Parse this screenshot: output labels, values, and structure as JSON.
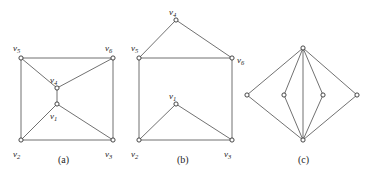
{
  "figure": {
    "background": "#ffffff",
    "edge_color": "#4c4c4c",
    "node_fill": "#ffffff",
    "node_stroke": "#333333",
    "label_color": "#242424"
  },
  "graphs": [
    {
      "id": "graph-a",
      "caption": "(a)",
      "caption_pos": {
        "x": 58,
        "y": 155
      },
      "vertices": [
        {
          "name": "v5",
          "base": "v",
          "sub": "5",
          "x": 21,
          "y": 58,
          "lx": 13,
          "ly": 44
        },
        {
          "name": "v6",
          "base": "v",
          "sub": "6",
          "x": 113,
          "y": 58,
          "lx": 105,
          "ly": 44
        },
        {
          "name": "v4",
          "base": "v",
          "sub": "4",
          "x": 57,
          "y": 88,
          "lx": 50,
          "ly": 76
        },
        {
          "name": "v1",
          "base": "v",
          "sub": "1",
          "x": 57,
          "y": 104,
          "lx": 50,
          "ly": 112
        },
        {
          "name": "v2",
          "base": "v",
          "sub": "2",
          "x": 21,
          "y": 140,
          "lx": 13,
          "ly": 150
        },
        {
          "name": "v3",
          "base": "v",
          "sub": "3",
          "x": 113,
          "y": 140,
          "lx": 105,
          "ly": 150
        }
      ],
      "edges": [
        {
          "from": "v5",
          "to": "v6"
        },
        {
          "from": "v5",
          "to": "v2"
        },
        {
          "from": "v2",
          "to": "v3"
        },
        {
          "from": "v3",
          "to": "v6"
        },
        {
          "from": "v5",
          "to": "v4"
        },
        {
          "from": "v4",
          "to": "v6"
        },
        {
          "from": "v2",
          "to": "v1"
        },
        {
          "from": "v1",
          "to": "v3"
        },
        {
          "from": "v4",
          "to": "v1"
        }
      ]
    },
    {
      "id": "graph-b",
      "caption": "(b)",
      "caption_pos": {
        "x": 177,
        "y": 155
      },
      "vertices": [
        {
          "name": "v4",
          "base": "v",
          "sub": "4",
          "x": 176,
          "y": 20,
          "lx": 169,
          "ly": 8
        },
        {
          "name": "v5",
          "base": "v",
          "sub": "5",
          "x": 139,
          "y": 58,
          "lx": 131,
          "ly": 44
        },
        {
          "name": "v6",
          "base": "v",
          "sub": "6",
          "x": 232,
          "y": 58,
          "lx": 237,
          "ly": 56
        },
        {
          "name": "v1",
          "base": "v",
          "sub": "1",
          "x": 176,
          "y": 104,
          "lx": 169,
          "ly": 92
        },
        {
          "name": "v2",
          "base": "v",
          "sub": "2",
          "x": 139,
          "y": 140,
          "lx": 131,
          "ly": 150
        },
        {
          "name": "v3",
          "base": "v",
          "sub": "3",
          "x": 232,
          "y": 140,
          "lx": 224,
          "ly": 150
        }
      ],
      "edges": [
        {
          "from": "v4",
          "to": "v5"
        },
        {
          "from": "v4",
          "to": "v6"
        },
        {
          "from": "v5",
          "to": "v6"
        },
        {
          "from": "v5",
          "to": "v2"
        },
        {
          "from": "v2",
          "to": "v3"
        },
        {
          "from": "v3",
          "to": "v6"
        },
        {
          "from": "v2",
          "to": "v1"
        },
        {
          "from": "v1",
          "to": "v3"
        }
      ]
    },
    {
      "id": "graph-c",
      "caption": "(c)",
      "caption_pos": {
        "x": 298,
        "y": 155
      },
      "vertices": [
        {
          "name": "top",
          "base": "",
          "sub": "",
          "x": 303,
          "y": 48,
          "lx": 0,
          "ly": 0
        },
        {
          "name": "left",
          "base": "",
          "sub": "",
          "x": 247,
          "y": 95,
          "lx": 0,
          "ly": 0
        },
        {
          "name": "il",
          "base": "",
          "sub": "",
          "x": 284,
          "y": 95,
          "lx": 0,
          "ly": 0
        },
        {
          "name": "ir",
          "base": "",
          "sub": "",
          "x": 323,
          "y": 95,
          "lx": 0,
          "ly": 0
        },
        {
          "name": "right",
          "base": "",
          "sub": "",
          "x": 357,
          "y": 95,
          "lx": 0,
          "ly": 0
        },
        {
          "name": "bot",
          "base": "",
          "sub": "",
          "x": 303,
          "y": 140,
          "lx": 0,
          "ly": 0
        }
      ],
      "edges": [
        {
          "from": "top",
          "to": "left"
        },
        {
          "from": "top",
          "to": "right"
        },
        {
          "from": "left",
          "to": "bot"
        },
        {
          "from": "right",
          "to": "bot"
        },
        {
          "from": "top",
          "to": "il"
        },
        {
          "from": "top",
          "to": "ir"
        },
        {
          "from": "il",
          "to": "bot"
        },
        {
          "from": "ir",
          "to": "bot"
        },
        {
          "from": "top",
          "to": "bot"
        }
      ]
    }
  ]
}
